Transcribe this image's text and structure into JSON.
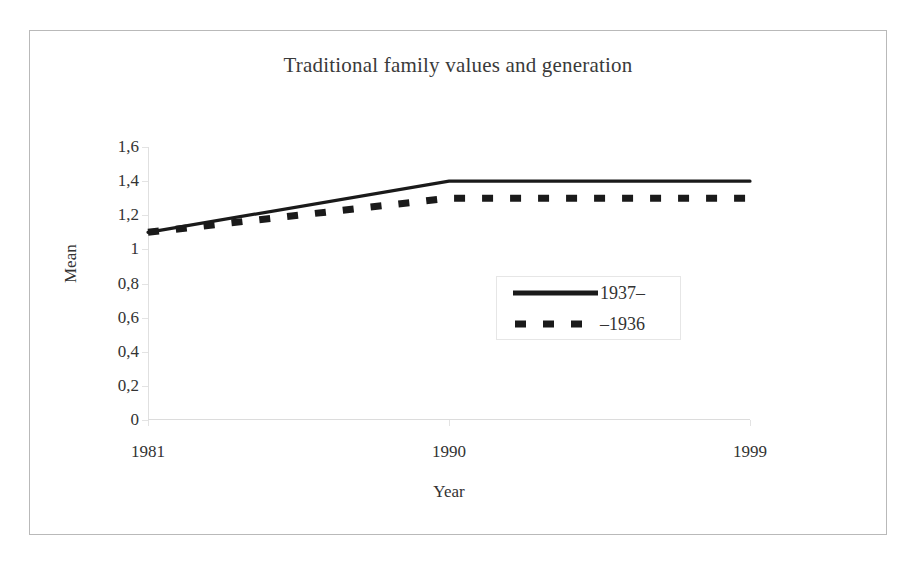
{
  "chart_data": {
    "type": "line",
    "title": "Traditional family values and generation",
    "xlabel": "Year",
    "ylabel": "Mean",
    "categories": [
      "1981",
      "1990",
      "1999"
    ],
    "x": [
      1981,
      1990,
      1999
    ],
    "series": [
      {
        "name": "1937–",
        "values": [
          1.1,
          1.4,
          1.4
        ],
        "style": "solid",
        "color": "#1a1a1a"
      },
      {
        "name": "–1936",
        "values": [
          1.1,
          1.3,
          1.3
        ],
        "style": "dashed",
        "color": "#1a1a1a"
      }
    ],
    "ylim": [
      0,
      1.6
    ],
    "ytick_labels": [
      "1,6",
      "1,4",
      "1,2",
      "1",
      "0,8",
      "0,6",
      "0,4",
      "0,2",
      "0"
    ],
    "ytick_values": [
      1.6,
      1.4,
      1.2,
      1.0,
      0.8,
      0.6,
      0.4,
      0.2,
      0
    ],
    "grid": false,
    "legend_position": "center-right",
    "decimal_separator": ","
  },
  "legend": {
    "entries": [
      {
        "label": "1937–",
        "style": "solid"
      },
      {
        "label": "–1936",
        "style": "dashed"
      }
    ]
  },
  "colors": {
    "line": "#1a1a1a",
    "axis": "#e0e0e0",
    "frame": "#b9b9b9",
    "text": "#333333",
    "background": "#ffffff"
  }
}
